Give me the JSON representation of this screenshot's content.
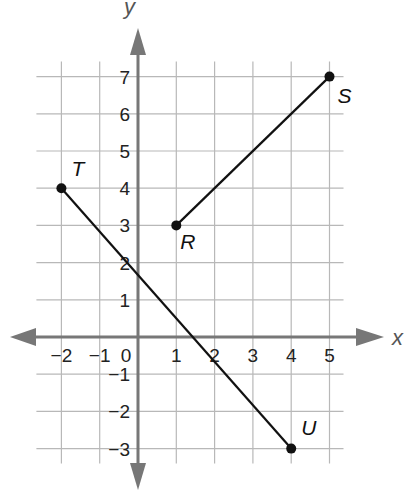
{
  "chart_data": {
    "type": "scatter",
    "title": "",
    "xlabel": "x",
    "ylabel": "y",
    "xlim": [
      -2,
      5
    ],
    "ylim": [
      -3,
      7
    ],
    "grid": true,
    "x_ticks": [
      "−2",
      "−1",
      "0",
      "1",
      "2",
      "3",
      "4",
      "5"
    ],
    "y_ticks": [
      "7",
      "6",
      "5",
      "4",
      "3",
      "2",
      "1",
      "−1",
      "−2",
      "−3"
    ],
    "points": [
      {
        "label": "T",
        "x": -2,
        "y": 4
      },
      {
        "label": "U",
        "x": 4,
        "y": -3
      },
      {
        "label": "R",
        "x": 1,
        "y": 3
      },
      {
        "label": "S",
        "x": 5,
        "y": 7
      }
    ],
    "segments": [
      {
        "name": "TU",
        "from": "T",
        "to": "U"
      },
      {
        "name": "RS",
        "from": "R",
        "to": "S"
      }
    ]
  },
  "axes": {
    "x_label": "x",
    "y_label": "y"
  },
  "colors": {
    "grid": "#b8b8b8",
    "axis": "#777777",
    "segment": "#111111"
  }
}
